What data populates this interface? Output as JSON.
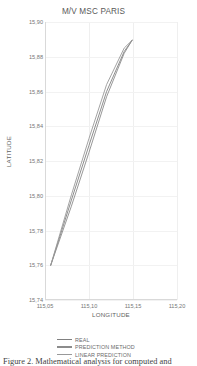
{
  "figure": {
    "caption": "Figure 2. Mathematical analysis for computed and"
  },
  "chart_data": {
    "type": "line",
    "title": "M/V MSC PARIS",
    "xlabel": "LONGITUDE",
    "ylabel": "LATITUDE",
    "xlim": [
      115.05,
      115.2
    ],
    "ylim": [
      15.74,
      15.9
    ],
    "xticks": [
      "115,05",
      "115,10",
      "115,15",
      "115,20"
    ],
    "xtick_values": [
      115.05,
      115.1,
      115.15,
      115.2
    ],
    "yticks": [
      "15,74",
      "15,76",
      "15,78",
      "15,80",
      "15,82",
      "15,84",
      "15,86",
      "15,88",
      "15,90"
    ],
    "ytick_values": [
      15.74,
      15.76,
      15.78,
      15.8,
      15.82,
      15.84,
      15.86,
      15.88,
      15.9
    ],
    "grid": true,
    "legend_position": "bottom",
    "series": [
      {
        "name": "REAL",
        "color": "#808080",
        "x": [
          115.0565,
          115.08,
          115.1,
          115.12,
          115.14,
          115.149
        ],
        "y": [
          15.76,
          15.7975,
          15.829,
          15.86,
          15.883,
          15.8895
        ]
      },
      {
        "name": "PREDICTION METHOD",
        "color": "#8c8c8c",
        "x": [
          115.0565,
          115.08,
          115.1,
          115.12,
          115.14,
          115.149
        ],
        "y": [
          15.76,
          15.794,
          15.825,
          15.857,
          15.882,
          15.8895
        ]
      },
      {
        "name": "LINEAR PREDICTION",
        "color": "#999999",
        "x": [
          115.0565,
          115.08,
          115.1,
          115.12,
          115.14,
          115.149
        ],
        "y": [
          15.76,
          15.8005,
          15.833,
          15.864,
          15.885,
          15.8895
        ]
      }
    ]
  }
}
